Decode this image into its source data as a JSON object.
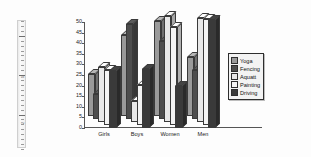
{
  "document": {
    "background_color": "#fdfdfd",
    "ruler": {
      "name": "vertical-ruler",
      "numbers": [
        "1",
        "2"
      ]
    }
  },
  "chart_data": {
    "type": "bar",
    "title": "",
    "subtitle": "",
    "xlabel": "",
    "ylabel": "",
    "style": "3d-clustered-column",
    "grid": false,
    "legend_position": "right",
    "ylim": [
      0,
      50
    ],
    "yticks": [
      0,
      5,
      10,
      15,
      20,
      25,
      30,
      35,
      40,
      45,
      50
    ],
    "ytick_labels": [
      "0",
      "5",
      "10",
      "15",
      "20",
      "25",
      "30",
      "35",
      "40",
      "45",
      "50"
    ],
    "categories": [
      "Girls",
      "Boys",
      "Women",
      "Men"
    ],
    "series": [
      {
        "name": "Yoga",
        "color": "#9a9a9a",
        "values": [
          20,
          38,
          45,
          28
        ]
      },
      {
        "name": "Fencing",
        "color": "#4d4d4d",
        "values": [
          12,
          45,
          37,
          23
        ]
      },
      {
        "name": "Aquatt",
        "color": "#e8e8e8",
        "values": [
          26,
          10,
          50,
          49
        ]
      },
      {
        "name": "Painting",
        "color": "#f4f4f4",
        "values": [
          26,
          19,
          46,
          50
        ]
      },
      {
        "name": "Driving",
        "color": "#3a3a3a",
        "values": [
          27,
          28,
          20,
          51
        ]
      }
    ]
  },
  "legend": {
    "name": "chart-legend",
    "items": [
      {
        "label": "Yoga",
        "color": "#9a9a9a"
      },
      {
        "label": "Fencing",
        "color": "#4d4d4d"
      },
      {
        "label": "Aquatt",
        "color": "#e8e8e8"
      },
      {
        "label": "Painting",
        "color": "#f4f4f4"
      },
      {
        "label": "Driving",
        "color": "#3a3a3a"
      }
    ]
  }
}
